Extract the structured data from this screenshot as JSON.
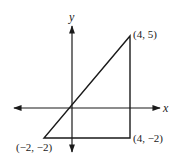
{
  "diagram": {
    "type": "coordinate-plane-triangle",
    "axes": {
      "x_label": "x",
      "y_label": "y"
    },
    "triangle": {
      "vertices": [
        {
          "x": 4,
          "y": 5,
          "label": "(4, 5)"
        },
        {
          "x": 4,
          "y": -2,
          "label": "(4, −2)"
        },
        {
          "x": -2,
          "y": -2,
          "label": "(−2, −2)"
        }
      ]
    },
    "colors": {
      "stroke": "#1a1a1a",
      "background": "#ffffff"
    }
  }
}
